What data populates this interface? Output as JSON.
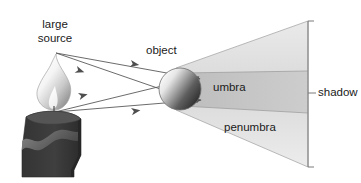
{
  "figure": {
    "width": 361,
    "height": 183,
    "background": "#ffffff"
  },
  "labels": {
    "large_source_line1": "large",
    "large_source_line2": "source",
    "object": "object",
    "umbra": "umbra",
    "penumbra": "penumbra",
    "shadow": "shadow"
  },
  "colors": {
    "penumbra_fill": "#e4e4e4",
    "umbra_fill": "#c6c6c6",
    "ray_stroke": "#5a5a5a",
    "outline_stroke": "#9a9a9a",
    "bracket_stroke": "#7a7a7a",
    "candle_body": "#3b3b3b",
    "candle_drip": "#6f6f6f",
    "flame_light": "#ffffff",
    "flame_shade": "#9b9b9b",
    "sphere_light": "#f2f2f2",
    "sphere_dark": "#3a3a3a",
    "text": "#1a1a1a"
  },
  "elements": {
    "source_top_point": [
      56,
      53
    ],
    "source_bottom_point": [
      55,
      112
    ],
    "sphere_center": [
      180,
      89
    ],
    "sphere_radius": 21,
    "screen_x": 308,
    "shadow_top_y": 21,
    "shadow_bottom_y": 167,
    "umbra_near_top_y": 76,
    "umbra_near_bottom_y": 103,
    "umbra_far_top_y": 71,
    "umbra_far_bottom_y": 113
  },
  "rays": [
    {
      "name": "ray-top-source-to-top-of-object",
      "from": [
        56,
        53
      ],
      "to": [
        200,
        79
      ]
    },
    {
      "name": "ray-top-source-to-bottom-of-object",
      "from": [
        56,
        53
      ],
      "to": [
        198,
        102
      ]
    },
    {
      "name": "ray-bottom-source-to-top-of-object",
      "from": [
        55,
        112
      ],
      "to": [
        199,
        77
      ]
    },
    {
      "name": "ray-bottom-source-to-bottom-of-object",
      "from": [
        55,
        112
      ],
      "to": [
        201,
        100
      ]
    }
  ]
}
